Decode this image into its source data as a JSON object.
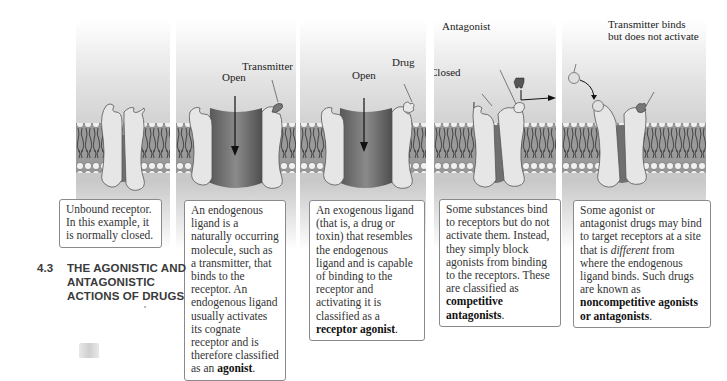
{
  "figure": {
    "section": {
      "number": "4.3",
      "title_line1": "THE AGONISTIC AND",
      "title_line2": "ANTAGONISTIC",
      "title_line3": "ACTIONS OF DRUGS"
    },
    "panels": [
      {
        "id": "unbound",
        "state": "closed",
        "labels": [],
        "caption": "Unbound receptor. In this example, it is normally closed."
      },
      {
        "id": "endogenous",
        "state": "open",
        "labels": [
          "Transmitter",
          "Open"
        ],
        "caption_parts": [
          "An endogenous ligand is a naturally occurring molecule, such as a transmitter, that binds to the receptor. An endogenous ligand usually activates its cognate receptor and is therefore classified as an ",
          "agonist",
          "."
        ]
      },
      {
        "id": "exogenous",
        "state": "open",
        "labels": [
          "Drug",
          "Open"
        ],
        "caption_parts": [
          "An exogenous ligand (that is, a drug or toxin) that resembles the endogenous ligand and is capable of binding to the receptor and activating it is classified as a ",
          "receptor agonist",
          "."
        ]
      },
      {
        "id": "competitive",
        "state": "closed",
        "labels": [
          "Antagonist",
          "Closed"
        ],
        "caption_parts": [
          "Some substances bind to receptors but do not activate them. Instead, they simply block agonists from binding to the receptors.  These are classified as ",
          "competitive antagonists",
          "."
        ]
      },
      {
        "id": "noncompetitive",
        "state": "closed",
        "labels": [
          "Noncompetitive antagonist",
          "Transmitter binds",
          "but does not activate"
        ],
        "caption_parts": [
          "Some agonist or antagonist drugs may bind to target receptors at a site that is ",
          "different",
          " from where the endogenous ligand binds. Such drugs are known as ",
          "noncompetitive agonists or antagonists",
          "."
        ]
      }
    ]
  }
}
